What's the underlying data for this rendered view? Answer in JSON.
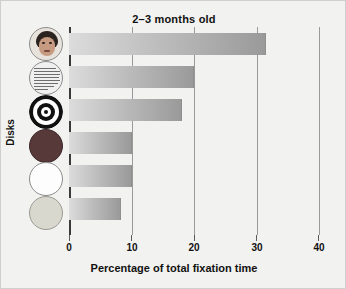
{
  "figure": {
    "background_color": "#f2f2f0",
    "border_color": "#cfcfcf"
  },
  "chart_data": {
    "type": "bar",
    "orientation": "horizontal",
    "title": "2–3 months old",
    "xlabel": "Percentage of total fixation time",
    "ylabel": "Disks",
    "xlim": [
      0,
      40
    ],
    "xticks": [
      0,
      10,
      20,
      30,
      40
    ],
    "xtick_labels": [
      "0",
      "10",
      "20",
      "30",
      "40"
    ],
    "grid": "vertical gridlines at 10, 20, 30, 40",
    "legend": "none",
    "categories": [
      "face",
      "printed text",
      "bullseye",
      "red disk",
      "white disk",
      "yellow disk"
    ],
    "values": [
      31.5,
      20.0,
      18.0,
      10.0,
      10.0,
      8.3
    ],
    "bar_gradient": [
      "#dcdcdc",
      "#9a9a9a"
    ],
    "bars": [
      {
        "label": "face",
        "value": 31.5
      },
      {
        "label": "printed text",
        "value": 20.0
      },
      {
        "label": "bullseye",
        "value": 18.0
      },
      {
        "label": "red disk",
        "value": 10.0
      },
      {
        "label": "white disk",
        "value": 10.0
      },
      {
        "label": "yellow disk",
        "value": 8.3
      }
    ]
  },
  "disks": [
    {
      "name": "face-disk",
      "icon": "face-disk-icon",
      "description": "schematic human face",
      "fill": "#e8e2dc"
    },
    {
      "name": "printed-text-disk",
      "icon": "printed-text-disk-icon",
      "description": "disk covered with lines of printed text",
      "fill": "#efefef"
    },
    {
      "name": "bullseye-disk",
      "icon": "bullseye-disk-icon",
      "description": "concentric black and white rings",
      "fill": "#ffffff"
    },
    {
      "name": "red-disk",
      "icon": "solid-disk-icon",
      "description": "plain dark red disk",
      "fill": "#58393a"
    },
    {
      "name": "white-disk",
      "icon": "solid-disk-icon",
      "description": "plain white disk",
      "fill": "#fdfdfd"
    },
    {
      "name": "yellow-disk",
      "icon": "solid-disk-icon",
      "description": "plain pale yellow disk",
      "fill": "#d8d8cf"
    }
  ]
}
